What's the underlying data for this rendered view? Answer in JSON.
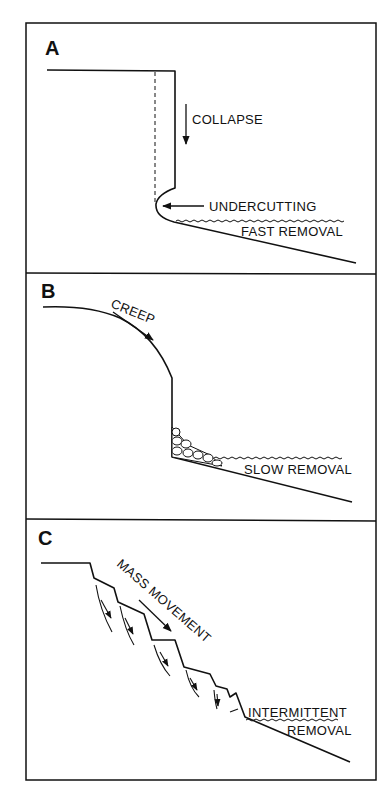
{
  "figure": {
    "panels": [
      {
        "letter": "A",
        "labels": {
          "collapse": "COLLAPSE",
          "undercutting": "UNDERCUTTING",
          "removal": "FAST REMOVAL"
        }
      },
      {
        "letter": "B",
        "labels": {
          "creep": "CREEP",
          "removal": "SLOW REMOVAL"
        }
      },
      {
        "letter": "C",
        "labels": {
          "mass_movement": "MASS MOVEMENT",
          "removal_line1": "INTERMITTENT",
          "removal_line2": "REMOVAL"
        }
      }
    ],
    "colors": {
      "ink": "#111111",
      "paper": "#ffffff"
    }
  }
}
